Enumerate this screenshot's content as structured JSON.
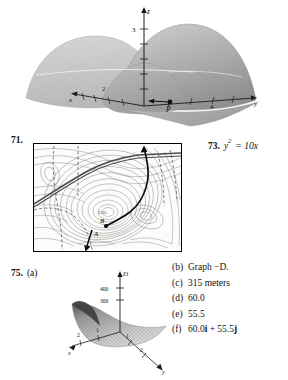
{
  "page": {
    "background": "#ffffff",
    "ink": "#111111"
  },
  "top_figure": {
    "name": "saddle-surface-plot",
    "axes": {
      "vertical_label": "z",
      "left_label": "x",
      "right_label": "y",
      "z_tick_label": "3",
      "x_tick_labels": [
        "4",
        "2"
      ],
      "y_tick_labels": [
        "4",
        "2"
      ]
    },
    "annotations": [
      {
        "label": "P",
        "kind": "point-with-arrow"
      }
    ]
  },
  "problem_71": {
    "number": "71.",
    "figure": {
      "name": "topographic-contour-map",
      "point_labels": [
        "A",
        "B"
      ],
      "summit_label": "3105",
      "features": [
        "contour-lines",
        "road",
        "trail",
        "stream",
        "path-from-A-to-B"
      ]
    }
  },
  "problem_73": {
    "number": "73.",
    "equation_lhs": "y",
    "equation_exponent": "2",
    "equation_rhs": "= 10x"
  },
  "problem_75": {
    "number": "75.",
    "part_a_tag": "(a)",
    "figure": {
      "name": "depth-surface-plot",
      "axes": {
        "vertical_label": "D",
        "left_label": "x",
        "right_label": "y"
      },
      "vertical_tick_labels": [
        "400",
        "300"
      ],
      "x_tick_labels": [
        "1",
        "2"
      ],
      "y_tick_labels": [
        "1",
        "2"
      ]
    },
    "answers": [
      {
        "tag": "(b)",
        "value": "Graph −D."
      },
      {
        "tag": "(c)",
        "value": "315 meters"
      },
      {
        "tag": "(d)",
        "value": "60.0"
      },
      {
        "tag": "(e)",
        "value": "55.5"
      },
      {
        "tag": "(f)",
        "value": "60.0i + 55.5j"
      }
    ]
  }
}
